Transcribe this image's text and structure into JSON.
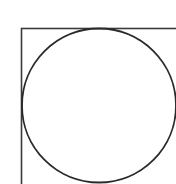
{
  "diagram": {
    "background": "#ffffff",
    "stroke_color": "#2a2a2a",
    "square": {
      "x": 21.5,
      "y": 28.5,
      "width": 160,
      "height": 160,
      "stroke_width": 1.6,
      "stroke_color": "#3a3a3a"
    },
    "circle": {
      "cx": 99,
      "cy": 105.5,
      "r": 77,
      "stroke_width": 1.8,
      "stroke_color": "#2a2a2a"
    }
  }
}
